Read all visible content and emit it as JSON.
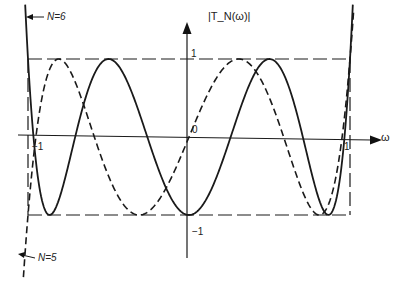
{
  "figure": {
    "y_axis_label": "|T_N(ω)|",
    "x_axis_label": "ω",
    "tick_labels": {
      "y_pos_one": "1",
      "y_neg_one": "−1",
      "origin": "0",
      "x_neg_one": "−1",
      "x_pos_one": "1"
    },
    "annotations": [
      {
        "text": "N=6",
        "points_to": "solid curve (left)"
      },
      {
        "text": "N=5",
        "points_to": "dashed curve (left)"
      }
    ]
  },
  "chart_data": {
    "type": "line",
    "xlabel": "ω",
    "ylabel": "|T_N(ω)|",
    "xlim": [
      -1.08,
      1.08
    ],
    "ylim": [
      -1.6,
      1.7
    ],
    "grid": false,
    "bounding_box": {
      "x": [
        -1,
        1
      ],
      "y": [
        -1,
        1
      ],
      "style": "dashed"
    },
    "series": [
      {
        "name": "N=5",
        "style": "dashed",
        "function": "cos(5·acos(ω))",
        "extrema_x": [
          -1,
          -0.809,
          -0.309,
          0.309,
          0.809,
          1
        ],
        "extrema_y": [
          -1,
          1,
          -1,
          1,
          -1,
          1
        ]
      },
      {
        "name": "N=6",
        "style": "solid",
        "function": "cos(6·acos(ω))",
        "extrema_x": [
          -1,
          -0.866,
          -0.5,
          0,
          0.5,
          0.866,
          1
        ],
        "extrema_y": [
          1,
          -1,
          1,
          -1,
          1,
          -1,
          1
        ]
      }
    ]
  }
}
